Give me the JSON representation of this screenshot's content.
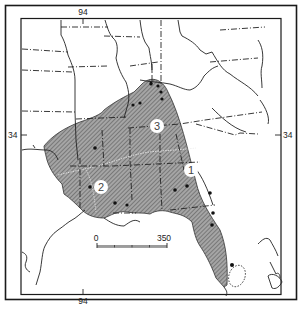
{
  "map": {
    "type": "range-distribution",
    "region": "Southeastern United States",
    "colors": {
      "frame": "#1a1a1a",
      "border": "#2a2a2a",
      "range_fill": "#9a9a9a",
      "hatch": "#555555",
      "background": "#ffffff",
      "point": "#111111",
      "zone_divider": "#e8e8e8"
    },
    "graticule": {
      "longitude_label_top": "94",
      "longitude_label_bottom": "94",
      "latitude_label_left": "34",
      "latitude_label_right": "34"
    },
    "zones": [
      {
        "id": "1",
        "label": "1"
      },
      {
        "id": "2",
        "label": "2"
      },
      {
        "id": "3",
        "label": "3"
      }
    ],
    "scale_bar": {
      "start_label": "0",
      "end_label": "350"
    },
    "legend_features": {
      "shaded_area": "species range",
      "dots": "collection localities",
      "dotted_outline": "disjunct population (south Florida)"
    }
  }
}
